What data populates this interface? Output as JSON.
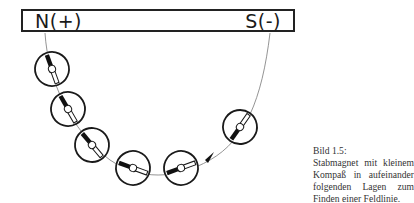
{
  "magnet": {
    "north_label": "N(+)",
    "south_label": "S(-)"
  },
  "caption": {
    "title": "Bild 1.5:",
    "text": "Stabmagnet mit kleinem Kompaß in aufeinander folgenden Lagen zum Finden einer Feldlinie."
  },
  "compasses": [
    {
      "cx": 52,
      "cy": 69,
      "angle": 160
    },
    {
      "cx": 68,
      "cy": 109,
      "angle": 150
    },
    {
      "cx": 92,
      "cy": 145,
      "angle": 140
    },
    {
      "cx": 133,
      "cy": 168,
      "angle": 110
    },
    {
      "cx": 181,
      "cy": 168,
      "angle": 70
    },
    {
      "cx": 240,
      "cy": 127,
      "angle": 35
    }
  ],
  "colors": {
    "line": "#777777",
    "ink": "#1a1a1a"
  }
}
